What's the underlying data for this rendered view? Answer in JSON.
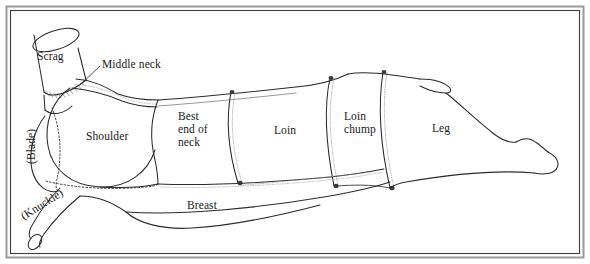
{
  "figure": {
    "view": "side profile, head to the left",
    "frame": {
      "style": "double rule rectangle border",
      "outer_color": "#8a8a8a",
      "inner_color": "#3c3c3c",
      "background_color": "#ffffff"
    },
    "ink_color": "#2b2b2b",
    "label_color": "#1a1a1a"
  },
  "labels": [
    {
      "id": "scrag",
      "text": "Scrag",
      "x": 37,
      "y": 57,
      "align": "left",
      "rotation": 0,
      "multiline": false
    },
    {
      "id": "middle-neck",
      "text": "Middle neck",
      "x": 102,
      "y": 59,
      "align": "left",
      "rotation": 0,
      "multiline": false,
      "has_leader_line": true
    },
    {
      "id": "shoulder",
      "text": "Shoulder",
      "x": 86,
      "y": 130,
      "align": "left",
      "rotation": 0,
      "multiline": false
    },
    {
      "id": "blade",
      "text": "(Blade)",
      "x": 30,
      "y": 140,
      "align": "center",
      "rotation": -90,
      "multiline": false
    },
    {
      "id": "knuckle",
      "text": "(Knuckle)",
      "x": 41,
      "y": 198,
      "align": "center",
      "rotation": -32,
      "multiline": false
    },
    {
      "id": "best-end",
      "text": "Best\nend of\nneck",
      "x": 178,
      "y": 115,
      "align": "left",
      "rotation": 0,
      "multiline": true
    },
    {
      "id": "loin",
      "text": "Loin",
      "x": 274,
      "y": 127,
      "align": "left",
      "rotation": 0,
      "multiline": false
    },
    {
      "id": "loin-chump",
      "text": "Loin\nchump",
      "x": 344,
      "y": 116,
      "align": "left",
      "rotation": 0,
      "multiline": true
    },
    {
      "id": "leg",
      "text": "Leg",
      "x": 432,
      "y": 126,
      "align": "left",
      "rotation": 0,
      "multiline": false
    },
    {
      "id": "breast",
      "text": "Breast",
      "x": 187,
      "y": 201,
      "align": "left",
      "rotation": 0,
      "multiline": false
    }
  ],
  "cuts": [
    "Scrag",
    "Middle neck",
    "Shoulder",
    "(Blade)",
    "(Knuckle)",
    "Best end of neck",
    "Loin",
    "Loin chump",
    "Leg",
    "Breast"
  ]
}
